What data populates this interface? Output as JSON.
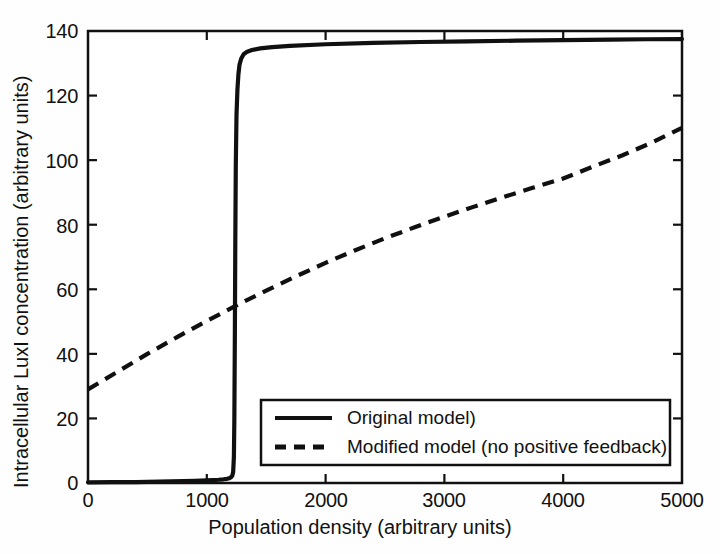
{
  "figure": {
    "background_color": "#fefefe",
    "axis_color": "#111111"
  },
  "chart_data": {
    "type": "line",
    "title": "",
    "subtitle": "",
    "xlabel": "Population density (arbitrary units)",
    "ylabel": "Intracellular LuxI concentration (arbitrary units)",
    "xlim": [
      0,
      5000
    ],
    "ylim": [
      0,
      140
    ],
    "xticks": [
      0,
      1000,
      2000,
      3000,
      4000,
      5000
    ],
    "yticks": [
      0,
      20,
      40,
      60,
      80,
      100,
      120,
      140
    ],
    "xtick_labels": [
      "0",
      "1000",
      "2000",
      "3000",
      "4000",
      "5000"
    ],
    "ytick_labels": [
      "0",
      "20",
      "40",
      "60",
      "80",
      "100",
      "120",
      "140"
    ],
    "grid": false,
    "legend_position": "lower right",
    "series": [
      {
        "name": "Original model)",
        "style": "solid",
        "color": "#101010",
        "linewidth": 4,
        "description": "Bistable switch-like response: near zero until population density ~1240, then sharp jump to a plateau of ~135-137.5",
        "x": [
          0,
          200,
          400,
          600,
          800,
          900,
          1000,
          1050,
          1100,
          1140,
          1170,
          1190,
          1205,
          1215,
          1222,
          1228,
          1232,
          1236,
          1240,
          1244,
          1250,
          1258,
          1266,
          1275,
          1290,
          1310,
          1340,
          1380,
          1450,
          1550,
          1700,
          2000,
          2400,
          2800,
          3200,
          3600,
          4000,
          4400,
          4700,
          5000
        ],
        "y": [
          0.2,
          0.25,
          0.3,
          0.4,
          0.55,
          0.65,
          0.8,
          0.9,
          1.0,
          1.15,
          1.3,
          1.5,
          1.8,
          2.3,
          3.5,
          8,
          20,
          45,
          75,
          98,
          114,
          122,
          126.5,
          129.5,
          131.5,
          132.8,
          133.6,
          134.1,
          134.6,
          135.0,
          135.4,
          135.9,
          136.3,
          136.6,
          136.8,
          137.0,
          137.2,
          137.35,
          137.45,
          137.5
        ]
      },
      {
        "name": "Modified model (no positive feedback)",
        "style": "dashed",
        "color": "#101010",
        "linewidth": 4,
        "dash_pattern": [
          12,
          8
        ],
        "description": "Graded saturating response rising from ~29 at density 0 to ~110 at density 5000",
        "x": [
          0,
          250,
          500,
          750,
          1000,
          1250,
          1500,
          1750,
          2000,
          2250,
          2500,
          2750,
          3000,
          3250,
          3500,
          3750,
          4000,
          4250,
          4500,
          4750,
          5000
        ],
        "y": [
          29,
          34.5,
          40,
          45.2,
          50.2,
          55,
          59.6,
          64,
          68.2,
          72.1,
          75.8,
          79.2,
          82.5,
          85.6,
          88.6,
          91.5,
          94.3,
          98.0,
          101.5,
          105.5,
          110
        ]
      }
    ]
  },
  "legend": {
    "entries": [
      {
        "label": "Original model)",
        "style": "solid"
      },
      {
        "label": "Modified model (no positive feedback)",
        "style": "dashed"
      }
    ]
  }
}
